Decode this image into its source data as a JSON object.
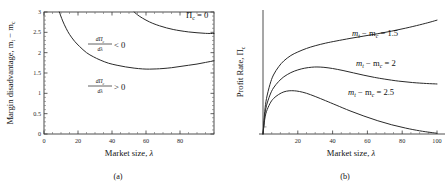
{
  "figure": {
    "panels": [
      {
        "id": "a",
        "caption": "(a)",
        "xlabel_text": "Market size, ",
        "xlabel_symbol": "λ",
        "ylabel_prefix": "Margin disadvantage, m",
        "ylabel_sub1": "t",
        "ylabel_mid": " − m",
        "ylabel_sub2": "c",
        "xticks": [
          0,
          20,
          40,
          60,
          80
        ],
        "xtick_labels": [
          "0",
          "20",
          "40",
          "60",
          "80"
        ],
        "yticks": [
          0,
          0.5,
          1,
          1.5,
          2,
          2.5,
          3
        ],
        "ytick_labels": [
          "0",
          "0.5",
          "1",
          "1.5",
          "2",
          "2.5",
          "3"
        ],
        "xlim": [
          0,
          100
        ],
        "ylim": [
          0,
          3
        ],
        "frame": "box",
        "annotations": [
          {
            "name": "pi-zero-label",
            "text": "Π",
            "sub": "c",
            "tail": " = 0",
            "x": 186,
            "y": 16
          },
          {
            "name": "derivative-negative-label",
            "num": "dΠ",
            "num_sub": "c",
            "den": "dλ",
            "rel": " < 0",
            "x": 100,
            "y": 45
          },
          {
            "name": "derivative-positive-label",
            "num": "dΠ",
            "num_sub": "c",
            "den": "dλ",
            "rel": " > 0",
            "x": 100,
            "y": 87
          }
        ]
      },
      {
        "id": "b",
        "caption": "(b)",
        "xlabel_text": "Market size, ",
        "xlabel_symbol": "λ",
        "ylabel_prefix": "Profit Rate, Π",
        "ylabel_sub2": "c",
        "xticks": [
          20,
          40,
          60,
          80,
          100
        ],
        "xtick_labels": [
          "20",
          "40",
          "60",
          "80",
          "100"
        ],
        "yticks": [],
        "ytick_labels": [],
        "xlim": [
          0,
          100
        ],
        "ylim": [
          0,
          1
        ],
        "frame": "axes",
        "annotations": [
          {
            "name": "curve-label-1",
            "lhs": "m",
            "sub1": "t",
            "mid": " − m",
            "sub2": "c",
            "tail": " = 1.5",
            "x": 352,
            "y": 36
          },
          {
            "name": "curve-label-2",
            "lhs": "m",
            "sub1": "t",
            "mid": " − m",
            "sub2": "c",
            "tail": " = 2",
            "x": 356,
            "y": 66
          },
          {
            "name": "curve-label-3",
            "lhs": "m",
            "sub1": "t",
            "mid": " − m",
            "sub2": "c",
            "tail": " = 2.5",
            "x": 348,
            "y": 95
          }
        ]
      }
    ]
  },
  "chart_data": [
    {
      "type": "line",
      "panel": "a",
      "title": "",
      "xlabel": "Market size, λ",
      "ylabel": "Margin disadvantage, m_t − m_c",
      "xlim": [
        0,
        100
      ],
      "ylim": [
        0,
        3
      ],
      "grid": false,
      "legend": "none",
      "xticks": [
        0,
        20,
        40,
        60,
        80
      ],
      "yticks": [
        0,
        0.5,
        1,
        1.5,
        2,
        2.5,
        3
      ],
      "series": [
        {
          "name": "dPi_c/dlambda = 0 boundary (lower)",
          "x": [
            9,
            11,
            13,
            15,
            18,
            21,
            25,
            29,
            33,
            38,
            43,
            48,
            53,
            58,
            62,
            66,
            70,
            75,
            80,
            85,
            90,
            95,
            100
          ],
          "y": [
            3.0,
            2.78,
            2.6,
            2.45,
            2.28,
            2.15,
            2.0,
            1.9,
            1.82,
            1.74,
            1.69,
            1.65,
            1.62,
            1.6,
            1.595,
            1.6,
            1.61,
            1.63,
            1.66,
            1.69,
            1.72,
            1.76,
            1.8
          ]
        },
        {
          "name": "Pi_c = 0 boundary (upper)",
          "x": [
            53,
            56,
            60,
            64,
            68,
            72,
            76,
            80,
            85,
            90,
            95,
            100
          ],
          "y": [
            3.0,
            2.9,
            2.8,
            2.72,
            2.66,
            2.61,
            2.57,
            2.54,
            2.51,
            2.49,
            2.475,
            2.47
          ]
        }
      ],
      "annotations": [
        "Π_c = 0",
        "dΠ_c/dλ < 0",
        "dΠ_c/dλ > 0"
      ]
    },
    {
      "type": "line",
      "panel": "b",
      "title": "",
      "xlabel": "Market size, λ",
      "ylabel": "Profit Rate, Π_c",
      "xlim": [
        0,
        100
      ],
      "ylim": [
        0,
        1
      ],
      "grid": false,
      "legend": "inline-labels",
      "xticks": [
        20,
        40,
        60,
        80,
        100
      ],
      "yticks": [],
      "series": [
        {
          "name": "m_t - m_c = 1.5",
          "x": [
            0,
            1,
            2,
            4,
            6,
            9,
            12,
            16,
            20,
            25,
            30,
            36,
            42,
            50,
            58,
            66,
            74,
            82,
            90,
            96,
            100
          ],
          "y": [
            0.0,
            0.19,
            0.3,
            0.42,
            0.5,
            0.57,
            0.62,
            0.665,
            0.695,
            0.725,
            0.748,
            0.77,
            0.788,
            0.81,
            0.83,
            0.85,
            0.872,
            0.897,
            0.925,
            0.948,
            0.965
          ]
        },
        {
          "name": "m_t - m_c = 2",
          "x": [
            0,
            1,
            2,
            4,
            6,
            9,
            12,
            16,
            20,
            24,
            28,
            31,
            35,
            40,
            46,
            52,
            58,
            64,
            70,
            78,
            86,
            94,
            100
          ],
          "y": [
            0.0,
            0.155,
            0.24,
            0.33,
            0.39,
            0.445,
            0.485,
            0.52,
            0.543,
            0.558,
            0.566,
            0.568,
            0.565,
            0.555,
            0.538,
            0.518,
            0.498,
            0.48,
            0.465,
            0.448,
            0.436,
            0.428,
            0.424
          ]
        },
        {
          "name": "m_t - m_c = 2.5",
          "x": [
            0,
            1,
            2,
            4,
            6,
            9,
            12,
            15,
            18,
            21,
            25,
            30,
            36,
            42,
            50,
            58,
            66,
            74,
            82,
            90,
            96,
            100
          ],
          "y": [
            0.0,
            0.125,
            0.19,
            0.258,
            0.3,
            0.335,
            0.357,
            0.366,
            0.366,
            0.36,
            0.345,
            0.318,
            0.282,
            0.245,
            0.196,
            0.152,
            0.112,
            0.078,
            0.05,
            0.027,
            0.014,
            0.006
          ]
        }
      ],
      "annotations": [
        "m_t − m_c = 1.5",
        "m_t − m_c = 2",
        "m_t − m_c = 2.5"
      ]
    }
  ],
  "colors": {
    "curve": "#2a2a2a",
    "axis": "#3a3a3a",
    "text": "#111111",
    "background": "#ffffff"
  }
}
